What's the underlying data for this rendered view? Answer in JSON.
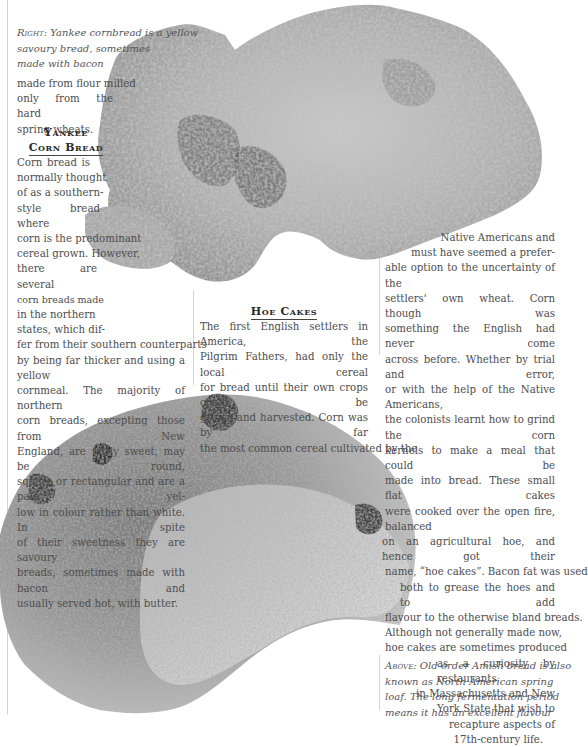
{
  "captions": {
    "right": {
      "lead": "Right:",
      "lines": [
        "Yankee cornbread is a  yellow",
        "savoury bread, sometimes",
        "made with bacon"
      ]
    },
    "above": {
      "lead": "Above:",
      "lines": [
        "Old-order Amish bread is also",
        "known as North American spring",
        "loaf. The long fermentation period",
        "means it has an excellent flavour"
      ]
    }
  },
  "left_column": {
    "intro_lines": [
      "made from flour milled",
      "only from the hard",
      "spring wheats."
    ],
    "heading_lines": [
      "Yankee",
      "Corn Bread"
    ],
    "body_lines": [
      "Corn bread is",
      "normally thought",
      "of as a southern-",
      "style bread where",
      "corn is the predominant",
      "cereal grown. However,",
      "there are several",
      "corn breads made",
      "in the northern",
      "states, which dif-",
      "fer from their southern counterparts",
      "by being far thicker and using a yellow",
      "cornmeal. The majority of northern",
      "corn breads, excepting those from New",
      "England, are fairly sweet, may be round,",
      "square or rectangular and are a pale yel-",
      "low in colour rather than white. In spite",
      "of their sweetness they are savoury",
      "breads, sometimes made with bacon and",
      "usually served hot, with butter."
    ]
  },
  "middle_column": {
    "heading": "Hoe Cakes",
    "body_lines": [
      "The first English settlers in America, the",
      "Pilgrim Fathers, had only the local cereal",
      "for bread until their own crops could be",
      "grown and harvested. Corn was by far",
      "the most common cereal cultivated by the"
    ]
  },
  "right_column": {
    "body_lines": [
      "Native Americans and",
      "must have seemed a prefer-",
      "able option to the uncertainty of the",
      "settlers' own wheat. Corn though was",
      "something the English had never come",
      "across before. Whether by trial and error,",
      "or with the help of the Native Americans,",
      "the colonists learnt how to grind the corn",
      "kernels to make a meal that could be",
      "made into bread. These small flat cakes",
      "were cooked over the open fire, balanced",
      "on an agricultural hoe, and hence got their",
      "name, “hoe cakes”. Bacon fat was used",
      "both to grease the hoes and to add",
      "flavour to the otherwise bland breads.",
      "Although not generally made now,",
      "hoe cakes are sometimes produced",
      "as a curiosity by restaurants",
      "in Massachusetts  and New",
      "York State that wish to",
      "recapture aspects of",
      "17th-century life."
    ]
  },
  "images": {
    "cornbread": "Yankee cornbread photo",
    "amish_loaf": "Old-order Amish bread photo"
  }
}
